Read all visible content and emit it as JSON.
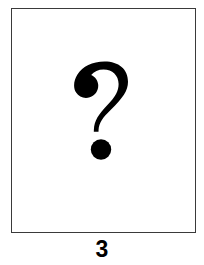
{
  "figure": {
    "caption_number": "3",
    "plate": {
      "background_color": "#ffffff",
      "border_color": "#3a3a3a",
      "symbol_name": "question-mark",
      "symbol_character": "?",
      "symbol_color": "#000000",
      "symbol_description": "Large bold question mark"
    }
  },
  "page": {
    "background_color": "#ffffff",
    "text_color": "#000000"
  }
}
